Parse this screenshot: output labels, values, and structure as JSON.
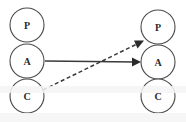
{
  "diagram": {
    "canvas": {
      "width": 186,
      "height": 122,
      "background": "#ffffff"
    },
    "style": {
      "node_fill": "#ffffff",
      "node_stroke": "#4a4a4a",
      "edge_color": "#3a3a3a",
      "label_color": "#2b2b2b",
      "node_radius": 17
    },
    "columns": [
      {
        "id": "left",
        "name": "left-column",
        "cx": 27,
        "nodes": [
          {
            "id": "left-p",
            "label": "P",
            "cx": 27,
            "cy": 25
          },
          {
            "id": "left-a",
            "label": "A",
            "cx": 27,
            "cy": 61
          },
          {
            "id": "left-c",
            "label": "C",
            "cx": 27,
            "cy": 96
          }
        ]
      },
      {
        "id": "right",
        "name": "right-column",
        "cx": 158,
        "nodes": [
          {
            "id": "right-p",
            "label": "P",
            "cx": 158,
            "cy": 27
          },
          {
            "id": "right-a",
            "label": "A",
            "cx": 158,
            "cy": 62
          },
          {
            "id": "right-c",
            "label": "C",
            "cx": 158,
            "cy": 96
          }
        ]
      }
    ],
    "edges": [
      {
        "id": "edge-a-to-a",
        "name": "edge-left-a-to-right-a",
        "style": "solid",
        "from": "left-a",
        "to": "right-a",
        "x1": 45,
        "y1": 61,
        "x2": 140,
        "y2": 62,
        "arrow": "end"
      },
      {
        "id": "edge-c-to-p",
        "name": "edge-left-c-to-right-p",
        "style": "dashed",
        "from": "left-c",
        "to": "right-p",
        "x1": 43,
        "y1": 90,
        "x2": 143,
        "y2": 41,
        "arrow": "end"
      }
    ],
    "artifacts": [
      {
        "id": "scan-band-1",
        "name": "scan-artifact-band",
        "top": 86,
        "height": 7
      },
      {
        "id": "scan-band-2",
        "name": "scan-artifact-band",
        "top": 113,
        "height": 9
      }
    ]
  }
}
